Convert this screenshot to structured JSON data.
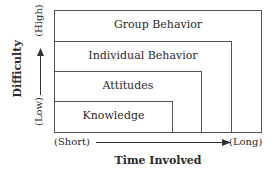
{
  "diagram": {
    "levels": [
      {
        "label": "Group Behavior"
      },
      {
        "label": "Individual Behavior"
      },
      {
        "label": "Attitudes"
      },
      {
        "label": "Knowledge"
      }
    ],
    "y_axis": {
      "title": "Difficulty",
      "low": "(Low)",
      "high": "(High)"
    },
    "x_axis": {
      "title": "Time Involved",
      "short": "(Short)",
      "long": "(Long)"
    }
  }
}
